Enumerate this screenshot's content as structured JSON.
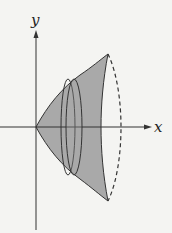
{
  "figure": {
    "type": "solid-of-revolution",
    "axes": {
      "x_label": "x",
      "y_label": "y"
    },
    "colors": {
      "solid_fill": "#a9a9a9",
      "outline": "#333333",
      "axis": "#333333",
      "background": "#f4f4f2"
    },
    "elements": {
      "solid": "shaded solid of revolution",
      "disc_slice": "thin disc cross-section",
      "far_edge": "dashed hidden back edge"
    }
  }
}
